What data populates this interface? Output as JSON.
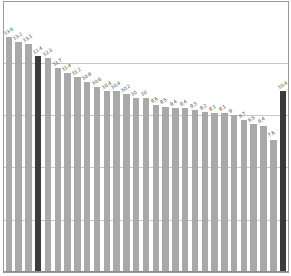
{
  "chart_data": {
    "type": "bar",
    "title": "",
    "subtitle": "",
    "xlabel": "",
    "ylabel": "",
    "ylim": [
      0,
      15.5
    ],
    "grid": true,
    "legend": "none",
    "categories": [
      "1",
      "2",
      "3",
      "4",
      "5",
      "6",
      "7",
      "8",
      "9",
      "10",
      "11",
      "12",
      "13",
      "14",
      "15",
      "16",
      "17",
      "18",
      "19",
      "20",
      "21",
      "22",
      "23",
      "24",
      "25",
      "26",
      "27",
      "28",
      "29"
    ],
    "values": [
      13.5,
      13.2,
      13.1,
      12.4,
      12.3,
      11.7,
      11.4,
      11.2,
      10.9,
      10.6,
      10.4,
      10.4,
      10.2,
      10,
      10,
      9.6,
      9.5,
      9.4,
      9.4,
      9.3,
      9.2,
      9.1,
      9.1,
      9,
      8.7,
      8.5,
      8.4,
      7.6,
      10.4
    ],
    "labels": [
      "13.5",
      "13.2",
      "13.1",
      "12.4",
      "12.3",
      "11.7",
      "11.4",
      "11.2",
      "10.9",
      "10.6",
      "10.4",
      "10.4",
      "10.2",
      "10",
      "10",
      "9.6",
      "9.5",
      "9.4",
      "9.4",
      "9.3",
      "9.2",
      "9.1",
      "9.1",
      "9",
      "8.7",
      "8.5",
      "8.4",
      "7.6",
      "10.4"
    ],
    "highlighted_indices": [
      3,
      28
    ],
    "bar_color": "#a9a9a9",
    "highlight_color": "#3b3b3b",
    "gridline_color": "#c9c9c9",
    "gridline_values": [
      3,
      6,
      9,
      12
    ],
    "label_color": "#4a4a4a"
  }
}
